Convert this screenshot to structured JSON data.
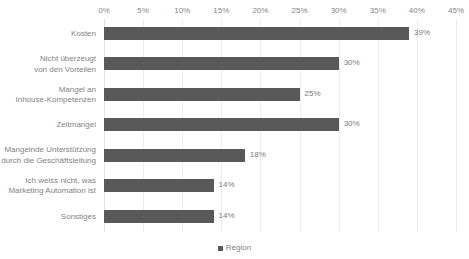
{
  "chart_data": {
    "type": "bar",
    "orientation": "horizontal",
    "title": "",
    "subtitle": "",
    "xlabel": "",
    "ylabel": "",
    "xlim": [
      0,
      45
    ],
    "xtick_labels": [
      "0%",
      "5%",
      "10%",
      "15%",
      "20%",
      "25%",
      "30%",
      "35%",
      "40%",
      "45%"
    ],
    "xtick_values": [
      0,
      5,
      10,
      15,
      20,
      25,
      30,
      35,
      40,
      45
    ],
    "grid": true,
    "legend_position": "bottom",
    "categories": [
      "Kosten",
      "Nicht überzeugt\nvon den Vorteilen",
      "Mangel an\nInhouse-Kompetenzen",
      "Zeitmangel",
      "Mangelnde Unterstützung\ndurch die Geschäftsleitung",
      "Ich weiss nicht, was\nMarketing Automation ist",
      "Sonstiges"
    ],
    "series": [
      {
        "name": "Region",
        "color": "#595959",
        "values": [
          39,
          30,
          25,
          30,
          18,
          14,
          14
        ],
        "value_labels": [
          "39%",
          "30%",
          "25%",
          "30%",
          "18%",
          "14%",
          "14%"
        ]
      }
    ],
    "colors": {
      "bar": "#595959",
      "gridline": "#ededed",
      "axis_text": "#868686",
      "label_text": "#838383",
      "value_text": "#7c7c7c",
      "background": "#ffffff"
    }
  },
  "legend": {
    "items": [
      {
        "label": "Region",
        "marker": "square-marker"
      }
    ]
  }
}
